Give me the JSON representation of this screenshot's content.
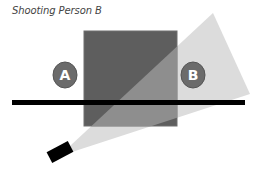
{
  "title": "Shooting Person B",
  "diagram": {
    "people": [
      {
        "id": "A",
        "label": "A",
        "cx": 65,
        "cy": 75
      },
      {
        "id": "B",
        "label": "B",
        "cx": 193,
        "cy": 75
      }
    ],
    "colors": {
      "block_dark": "#5e5e5e",
      "block_lit": "#8e8e8e",
      "block_border": "#7a7a7a",
      "light_cone": "#dcdcdc",
      "line": "#000000",
      "camera": "#000000",
      "person_fill": "#6b6b6b",
      "person_stroke": "#555555",
      "person_text": "#ffffff"
    }
  }
}
